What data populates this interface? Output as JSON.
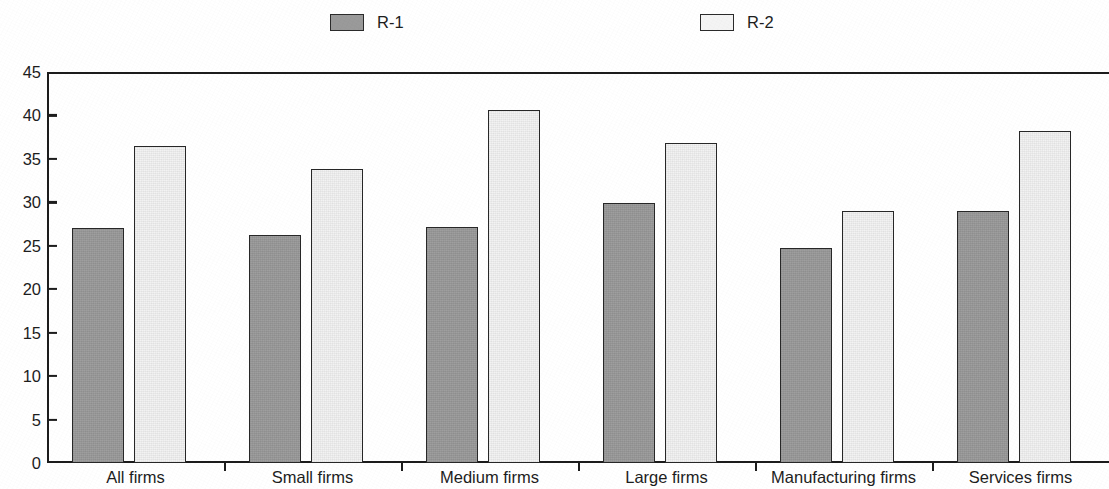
{
  "chart_data": {
    "type": "bar",
    "title": "",
    "subtitle": "",
    "xlabel": "",
    "ylabel": "",
    "ylim": [
      0,
      45
    ],
    "y_ticks": [
      0,
      5,
      10,
      15,
      20,
      25,
      30,
      35,
      40,
      45
    ],
    "grid": false,
    "legend_position": "top",
    "categories": [
      "All firms",
      "Small firms",
      "Medium firms",
      "Large firms",
      "Manufacturing firms",
      "Services firms"
    ],
    "series": [
      {
        "name": "R-1",
        "color": "#9a9a9a",
        "border_color": "#272727",
        "values": [
          27.0,
          26.2,
          27.2,
          29.9,
          24.7,
          29.0
        ]
      },
      {
        "name": "R-2",
        "color": "#f3f3f3",
        "border_color": "#272727",
        "values": [
          36.5,
          33.8,
          40.6,
          36.8,
          29.0,
          38.2
        ]
      }
    ]
  },
  "legend": {
    "entries": [
      {
        "label": "R-1",
        "swatch": "legend-swatch-r1"
      },
      {
        "label": "R-2",
        "swatch": "legend-swatch-r2"
      }
    ]
  },
  "axes": {
    "y_tick_labels": [
      "45",
      "40",
      "35",
      "30",
      "25",
      "20",
      "15",
      "10",
      "5",
      "0"
    ],
    "x_tick_labels": [
      "All firms",
      "Small firms",
      "Medium firms",
      "Large firms",
      "Manufacturing firms",
      "Services firms"
    ]
  },
  "colors": {
    "series_r1": "#9a9a9a",
    "series_r2": "#f3f3f3",
    "axis": "#1c1c1c",
    "text": "#1d1d1d",
    "background": "#ffffff"
  }
}
